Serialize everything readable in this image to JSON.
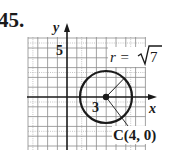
{
  "problem_number": "45.",
  "axes": {
    "x_label": "x",
    "y_label": "y"
  },
  "tick_labels": {
    "y_tick": "5",
    "x_tick": "3"
  },
  "circle": {
    "center_label": "C(4, 0)",
    "radius_label_prefix": "r = ",
    "radius_label_value": "7",
    "center": [
      4,
      0
    ],
    "radius": "√7"
  },
  "colors": {
    "ink": "#1a1a1a",
    "grid": "#8a8a8a"
  }
}
